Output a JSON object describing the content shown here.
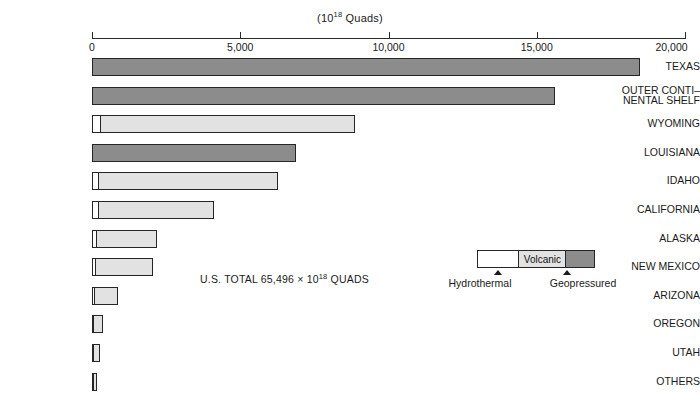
{
  "chart_data": {
    "type": "bar",
    "orientation": "horizontal",
    "title_prefix": "(10",
    "title_exponent": "18",
    "title_suffix": " Quads)",
    "xlabel": "",
    "ylabel": "",
    "xlim": [
      0,
      20000
    ],
    "grid": false,
    "tick_values": [
      0,
      5000,
      10000,
      15000,
      20000
    ],
    "tick_labels": [
      "0",
      "5,000",
      "10,000",
      "15,000",
      "20,000"
    ],
    "categories": [
      "TEXAS",
      "OUTER CONTI–\nNENTAL SHELF",
      "WYOMING",
      "LOUISIANA",
      "IDAHO",
      "CALIFORNIA",
      "ALASKA",
      "NEW MEXICO",
      "ARIZONA",
      "OREGON",
      "UTAH",
      "OTHERS"
    ],
    "stack_order": [
      "hydrothermal",
      "volcanic",
      "geopressured"
    ],
    "series": [
      {
        "name": "Hydrothermal",
        "color": "#ffffff",
        "values": [
          0,
          0,
          260,
          0,
          200,
          200,
          130,
          120,
          60,
          40,
          60,
          30
        ]
      },
      {
        "name": "Volcanic",
        "color": "#e2e2e2",
        "values": [
          0,
          0,
          8610,
          0,
          6070,
          3910,
          2060,
          1940,
          820,
          330,
          200,
          90
        ]
      },
      {
        "name": "Geopressured",
        "color": "#8c8c8c",
        "values": [
          18480,
          15610,
          0,
          6880,
          0,
          0,
          0,
          0,
          0,
          0,
          0,
          0
        ]
      }
    ],
    "totals": [
      18480,
      15610,
      8870,
      6880,
      6270,
      4110,
      2190,
      2060,
      880,
      370,
      260,
      120
    ],
    "annotations": [
      {
        "name": "us-total",
        "text": "U.S. TOTAL 65,496 × 10¹⁸ QUADS",
        "text_prefix": "U.S. TOTAL 65,496 × 10",
        "text_exponent": "18",
        "text_suffix": " QUADS"
      }
    ]
  },
  "axis": {
    "title_prefix": "(10",
    "title_exponent": "18",
    "title_suffix": " Quads)",
    "ticks": [
      {
        "value": 0,
        "label": "0"
      },
      {
        "value": 5000,
        "label": "5,000"
      },
      {
        "value": 10000,
        "label": "10,000"
      },
      {
        "value": 15000,
        "label": "15,000"
      },
      {
        "value": 20000,
        "label": "20,000"
      }
    ]
  },
  "rows": [
    {
      "label": "TEXAS",
      "two_line": false
    },
    {
      "label": "OUTER CONTI–\nNENTAL SHELF",
      "two_line": true
    },
    {
      "label": "WYOMING",
      "two_line": false
    },
    {
      "label": "LOUISIANA",
      "two_line": false
    },
    {
      "label": "IDAHO",
      "two_line": false
    },
    {
      "label": "CALIFORNIA",
      "two_line": false
    },
    {
      "label": "ALASKA",
      "two_line": false
    },
    {
      "label": "NEW MEXICO",
      "two_line": false
    },
    {
      "label": "ARIZONA",
      "two_line": false
    },
    {
      "label": "OREGON",
      "two_line": false
    },
    {
      "label": "UTAH",
      "two_line": false
    },
    {
      "label": "OTHERS",
      "two_line": false
    }
  ],
  "note": {
    "prefix": "U.S. TOTAL 65,496 × 10",
    "exponent": "18",
    "suffix": " QUADS"
  },
  "legend": {
    "segments": [
      {
        "key": "hydrothermal",
        "inline_label": "",
        "outside_label": "Hydrothermal",
        "color": "#ffffff"
      },
      {
        "key": "volcanic",
        "inline_label": "Volcanic",
        "outside_label": "",
        "color": "#e2e2e2"
      },
      {
        "key": "geopressured",
        "inline_label": "",
        "outside_label": "Geopressured",
        "color": "#8c8c8c"
      }
    ],
    "hydrothermal_label": "Hydrothermal",
    "volcanic_label": "Volcanic",
    "geopressured_label": "Geopressured"
  },
  "colors": {
    "hydrothermal": "#ffffff",
    "volcanic": "#e2e2e2",
    "geopressured": "#8c8c8c",
    "outline": "#262626",
    "text": "#1a1a1a"
  }
}
